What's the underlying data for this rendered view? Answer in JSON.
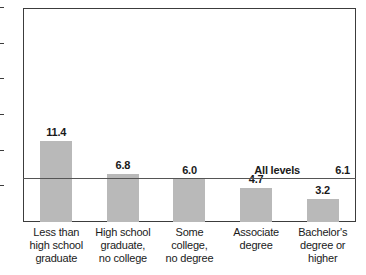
{
  "chart_data": {
    "type": "bar",
    "title": "",
    "subtitle": "",
    "xlabel": "",
    "ylabel": "",
    "ylim": [
      0,
      30
    ],
    "yticks": [
      0,
      5,
      10,
      15,
      20,
      25,
      30
    ],
    "ytick_labels": [
      "0",
      "5",
      "10",
      "15",
      "20",
      "25",
      "30"
    ],
    "grid": false,
    "legend": "none",
    "bar_color": "#b9b9b9",
    "axis_color": "#3c3c3c",
    "categories": [
      "Less than high school graduate",
      "High school graduate, no college",
      "Some college, no degree",
      "Associate degree",
      "Bachelor's degree or higher"
    ],
    "category_lines": [
      [
        "Less than",
        "high school",
        "graduate"
      ],
      [
        "High school",
        "graduate,",
        "no college"
      ],
      [
        "Some college,",
        "no degree"
      ],
      [
        "Associate",
        "degree"
      ],
      [
        "Bachelor's",
        "degree or",
        "higher"
      ]
    ],
    "values": [
      11.4,
      6.8,
      6.0,
      4.7,
      3.2
    ],
    "value_labels": [
      "11.4",
      "6.8",
      "6.0",
      "4.7",
      "3.2"
    ],
    "annotations": [
      {
        "type": "hline",
        "name": "All levels",
        "value": 6.1,
        "value_label": "6.1",
        "color": "#555555"
      }
    ]
  }
}
